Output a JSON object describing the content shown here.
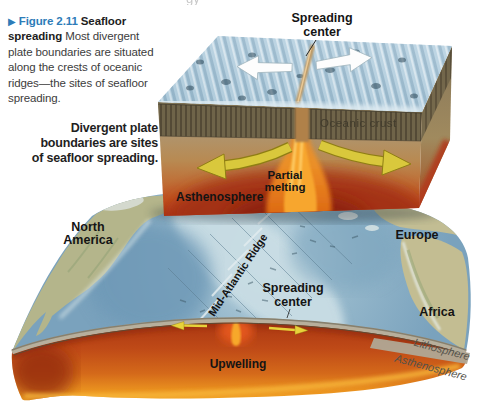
{
  "page": {
    "background": "#ffffff",
    "fragment": "gy"
  },
  "caption": {
    "marker": "▶",
    "figure_label": "Figure 2.11",
    "figure_title": "Seafloor spreading",
    "body": "Most divergent plate boundaries are situated along the crests of oceanic ridges—the sites of seafloor spreading.",
    "label_color": "#2d7cb8"
  },
  "annotation": {
    "text": "Divergent plate boundaries are sites of seafloor spreading."
  },
  "block_diagram": {
    "labels": {
      "spreading_center": [
        "Spreading",
        "center"
      ],
      "oceanic_crust": "Oceanic crust",
      "partial_melting": [
        "Partial",
        "melting"
      ],
      "asthenosphere": "Asthenosphere"
    },
    "colors": {
      "seafloor_top": "#b7d1e0",
      "oceanic_crust_band": "#6f6449",
      "asthenosphere_tan": "#b8905c",
      "partial_melt_red": "#b13a1a",
      "magma_orange": "#f59d22",
      "flow_arrow_yellow": "#d9c83c",
      "spreading_arrow_white": "#ffffff"
    }
  },
  "globe": {
    "labels": {
      "north_america": [
        "North",
        "America"
      ],
      "europe": "Europe",
      "africa": "Africa",
      "mid_atlantic_ridge": "Mid-Atlantic Ridge",
      "spreading_center": [
        "Spreading",
        "center"
      ],
      "upwelling": "Upwelling",
      "lithosphere": "Lithosphere",
      "asthenosphere": "Asthenosphere"
    },
    "colors": {
      "ocean": "#8fb3c9",
      "ridge_highlight": "#c6dbe3",
      "continent": "#bdb88e",
      "mantle_red": "#bf4a17",
      "mantle_orange": "#f3a727",
      "lithosphere_band": "#b0a895",
      "arrow_yellow": "#e8d23a"
    }
  }
}
